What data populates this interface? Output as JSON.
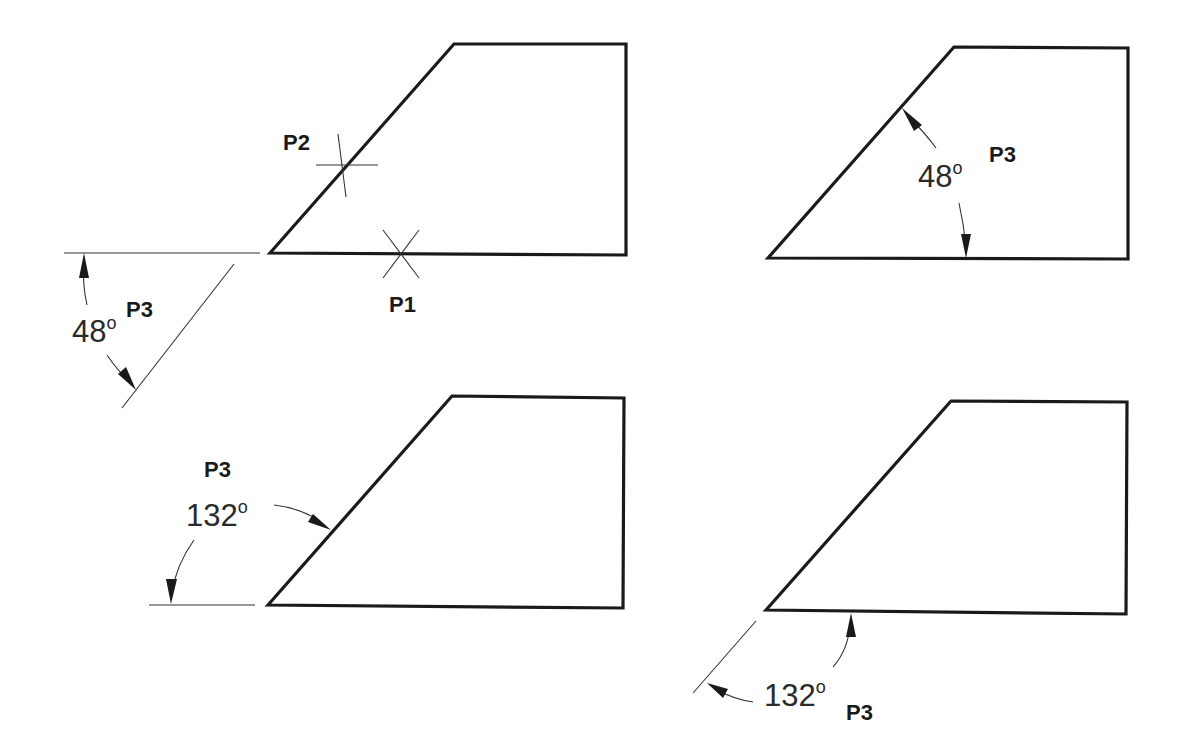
{
  "diagram": {
    "type": "technical-drawing",
    "panels": [
      {
        "id": "top-left",
        "points": [
          {
            "label": "P1"
          },
          {
            "label": "P2"
          },
          {
            "label": "P3"
          }
        ],
        "dimension": {
          "value": "48",
          "unit": "°",
          "text": "48°"
        }
      },
      {
        "id": "top-right",
        "points": [
          {
            "label": "P3"
          }
        ],
        "dimension": {
          "value": "48",
          "unit": "°",
          "text": "48°"
        }
      },
      {
        "id": "bottom-left",
        "points": [
          {
            "label": "P3"
          }
        ],
        "dimension": {
          "value": "132",
          "unit": "°",
          "text": "132°"
        }
      },
      {
        "id": "bottom-right",
        "points": [
          {
            "label": "P3"
          }
        ],
        "dimension": {
          "value": "132",
          "unit": "°",
          "text": "132°"
        }
      }
    ]
  },
  "labels": {
    "p1": "P1",
    "p2": "P2",
    "p3": "P3",
    "deg48": "48",
    "deg132": "132",
    "degree_symbol": "o"
  },
  "colors": {
    "stroke": "#1a1a1a",
    "background": "#ffffff"
  }
}
